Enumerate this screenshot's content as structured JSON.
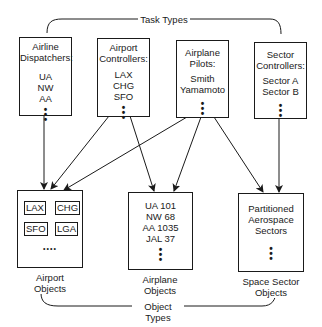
{
  "top_group_label": "Task Types",
  "bottom_group_label": "Object Types",
  "task_types": [
    {
      "title_lines": [
        "Airline",
        "Dispatchers:"
      ],
      "items": [
        "UA",
        "NW",
        "AA"
      ],
      "dots": "•\n•\n•"
    },
    {
      "title_lines": [
        "Airport",
        "Controllers:"
      ],
      "items": [
        "LAX",
        "CHG",
        "SFO"
      ],
      "dots": "•\n•\n•"
    },
    {
      "title_lines": [
        "Airplane",
        "Pilots:"
      ],
      "items": [
        "Smith",
        "Yamamoto"
      ],
      "dots": "•\n•\n•"
    },
    {
      "title_lines": [
        "Sector",
        "Controllers:"
      ],
      "items": [
        "Sector A",
        "Sector B"
      ],
      "dots": "•\n•\n•"
    }
  ],
  "object_types": [
    {
      "label_lines": [
        "Airport",
        "Objects"
      ],
      "mini_boxes": [
        "LAX",
        "CHG",
        "SFO",
        "LGA"
      ],
      "dots": "••••"
    },
    {
      "label_lines": [
        "Airplane",
        "Objects"
      ],
      "items": [
        "UA 101",
        "NW 68",
        "AA 1035",
        "JAL 37"
      ],
      "dots": "•\n•\n•"
    },
    {
      "label_lines": [
        "Space Sector",
        "Objects"
      ],
      "items": [
        "Partitioned",
        "Aerospace",
        "Sectors"
      ],
      "dots": "•\n•\n•"
    }
  ],
  "arrows": [
    {
      "from": "Airline Dispatchers",
      "to": "Airport Objects"
    },
    {
      "from": "Airport Controllers",
      "to": "Airport Objects"
    },
    {
      "from": "Airport Controllers",
      "to": "Airplane Objects"
    },
    {
      "from": "Airplane Pilots",
      "to": "Airport Objects"
    },
    {
      "from": "Airplane Pilots",
      "to": "Airplane Objects"
    },
    {
      "from": "Airplane Pilots",
      "to": "Space Sector Objects"
    },
    {
      "from": "Sector Controllers",
      "to": "Space Sector Objects"
    }
  ]
}
